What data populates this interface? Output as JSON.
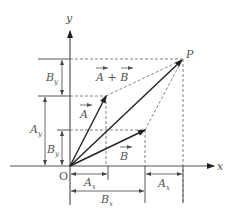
{
  "diagram": {
    "axes": {
      "x_label": "x",
      "y_label": "y",
      "origin_label": "O"
    },
    "point_label": "P",
    "vectors": {
      "A": {
        "label": "A",
        "components": [
          "A_x",
          "A_y"
        ]
      },
      "B": {
        "label": "B",
        "components": [
          "B_x",
          "B_y"
        ]
      },
      "sum": {
        "label": "A + B"
      }
    },
    "dimension_labels": {
      "Ax_bottom": "A",
      "Ax_bottom_sub": "x",
      "Bx_bottom": "B",
      "Bx_bottom_sub": "x",
      "Ax_right": "A",
      "Ax_right_sub": "x",
      "Ay_left": "A",
      "Ay_left_sub": "y",
      "By_lower": "B",
      "By_lower_sub": "y",
      "By_upper": "B",
      "By_upper_sub": "y"
    },
    "colors": {
      "line": "#333333",
      "dashed": "#666666",
      "text": "#555555"
    }
  }
}
